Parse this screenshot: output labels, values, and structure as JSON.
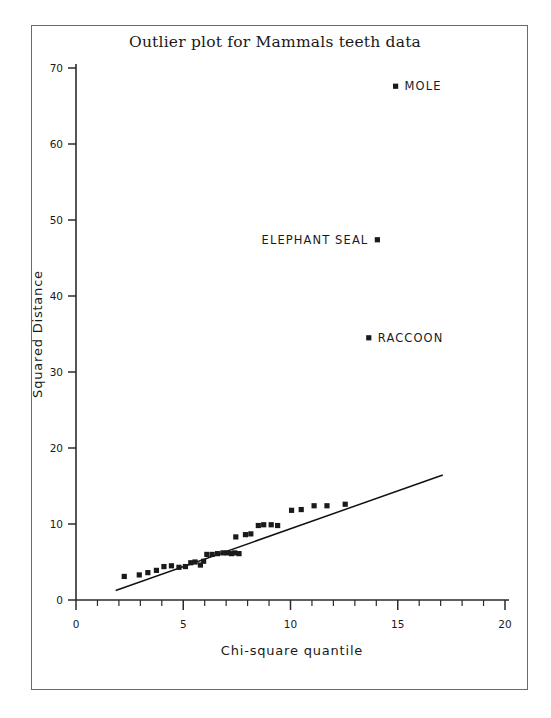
{
  "chart_data": {
    "type": "scatter",
    "title": "Outlier plot for Mammals teeth data",
    "xlabel": "Chi-square quantile",
    "ylabel": "Squared Distance",
    "xlim": [
      0,
      20
    ],
    "ylim": [
      0,
      70
    ],
    "xticks": [
      0,
      5,
      10,
      15,
      20
    ],
    "yticks": [
      0,
      10,
      20,
      30,
      40,
      50,
      60,
      70
    ],
    "xticklabels": [
      "0",
      "5",
      "10",
      "15",
      "20"
    ],
    "yticklabels": [
      "0",
      "10",
      "20",
      "30",
      "40",
      "50",
      "60",
      "70"
    ],
    "x_minor_tick_step": 1,
    "grid": false,
    "legend": null,
    "marker": "square",
    "marker_color": "#1a1a1a",
    "series": [
      {
        "name": "Squared Distance vs Chi-square quantile",
        "points": [
          [
            2.25,
            3.1
          ],
          [
            2.95,
            3.3
          ],
          [
            3.35,
            3.6
          ],
          [
            3.75,
            3.9
          ],
          [
            4.1,
            4.4
          ],
          [
            4.45,
            4.5
          ],
          [
            4.8,
            4.3
          ],
          [
            5.1,
            4.4
          ],
          [
            5.35,
            4.9
          ],
          [
            5.55,
            5.0
          ],
          [
            5.8,
            4.6
          ],
          [
            5.95,
            5.1
          ],
          [
            6.1,
            6.0
          ],
          [
            6.35,
            6.0
          ],
          [
            6.6,
            6.1
          ],
          [
            6.85,
            6.2
          ],
          [
            7.05,
            6.2
          ],
          [
            7.25,
            6.1
          ],
          [
            7.4,
            6.2
          ],
          [
            7.6,
            6.1
          ],
          [
            7.45,
            8.3
          ],
          [
            7.9,
            8.6
          ],
          [
            8.15,
            8.7
          ],
          [
            8.5,
            9.8
          ],
          [
            8.75,
            9.9
          ],
          [
            9.1,
            9.9
          ],
          [
            9.4,
            9.8
          ],
          [
            10.05,
            11.8
          ],
          [
            10.5,
            11.9
          ],
          [
            11.1,
            12.4
          ],
          [
            11.7,
            12.4
          ],
          [
            12.55,
            12.6
          ]
        ]
      }
    ],
    "labeled_points": [
      {
        "label": "MOLE",
        "x": 14.9,
        "y": 67.6,
        "label_side": "right"
      },
      {
        "label": "ELEPHANT SEAL",
        "x": 14.05,
        "y": 47.4,
        "label_side": "left"
      },
      {
        "label": "RACCOON",
        "x": 13.65,
        "y": 34.5,
        "label_side": "right"
      }
    ],
    "reference_line": {
      "x0": 1.85,
      "y0": 1.25,
      "x1": 17.1,
      "y1": 16.45,
      "color": "#111111"
    }
  }
}
